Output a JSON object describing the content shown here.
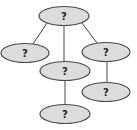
{
  "diagram": {
    "type": "tree",
    "colors": {
      "node_fill": "#dcdcdc",
      "node_stroke": "#4a4a4a",
      "edge": "#444444"
    },
    "nodes": [
      {
        "id": "root",
        "label": "?",
        "cx": 64,
        "cy": 16,
        "rx": 25,
        "ry": 9.5
      },
      {
        "id": "left",
        "label": "?",
        "cx": 25,
        "cy": 53,
        "rx": 24,
        "ry": 9.5
      },
      {
        "id": "middle",
        "label": "?",
        "cx": 65,
        "cy": 71,
        "rx": 25,
        "ry": 9.5
      },
      {
        "id": "right",
        "label": "?",
        "cx": 106,
        "cy": 52,
        "rx": 24,
        "ry": 9.5
      },
      {
        "id": "middle-child",
        "label": "?",
        "cx": 65,
        "cy": 114,
        "rx": 25,
        "ry": 9.5
      },
      {
        "id": "right-child",
        "label": "?",
        "cx": 106,
        "cy": 92,
        "rx": 24,
        "ry": 9.5
      }
    ],
    "edges": [
      {
        "from": "root",
        "to": "left",
        "x1": 47,
        "y1": 23,
        "x2": 33,
        "y2": 44
      },
      {
        "from": "root",
        "to": "middle",
        "x1": 64,
        "y1": 25,
        "x2": 64,
        "y2": 62
      },
      {
        "from": "root",
        "to": "right",
        "x1": 82,
        "y1": 23,
        "x2": 97,
        "y2": 43
      },
      {
        "from": "middle",
        "to": "middle-child",
        "x1": 65,
        "y1": 80,
        "x2": 65,
        "y2": 105
      },
      {
        "from": "right",
        "to": "right-child",
        "x1": 107,
        "y1": 61,
        "x2": 107,
        "y2": 83
      }
    ]
  }
}
